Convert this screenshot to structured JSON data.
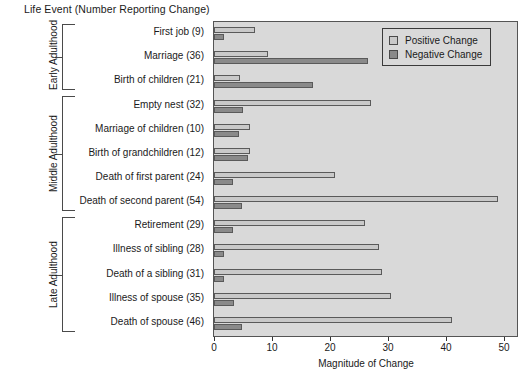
{
  "chart_data": {
    "type": "bar",
    "orientation": "horizontal",
    "title": "Life Event (Number Reporting Change)",
    "xlabel": "Magnitude of Change",
    "ylabel": "",
    "xlim": [
      0,
      50
    ],
    "xticks": [
      0,
      10,
      20,
      30,
      40,
      50
    ],
    "grid": false,
    "legend_position": "top-right",
    "legend": [
      "Positive Change",
      "Negative Change"
    ],
    "categories": [
      "First job (9)",
      "Marriage (36)",
      "Birth of children (21)",
      "Empty nest (32)",
      "Marriage of children (10)",
      "Birth of grandchildren (12)",
      "Death of first parent (24)",
      "Death of second parent (54)",
      "Retirement (29)",
      "Illness of sibling (28)",
      "Death of a sibling (31)",
      "Illness of spouse (35)",
      "Death of spouse (46)"
    ],
    "series": [
      {
        "name": "Positive Change",
        "color": "#c9c9c9",
        "values": [
          7.0,
          9.3,
          4.5,
          27.0,
          6.2,
          6.2,
          20.8,
          49.0,
          26.0,
          28.5,
          29.0,
          30.5,
          41.0
        ]
      },
      {
        "name": "Negative Change",
        "color": "#8a8a8a",
        "values": [
          1.7,
          26.5,
          17.0,
          5.0,
          4.3,
          5.8,
          3.2,
          4.8,
          3.3,
          1.7,
          1.8,
          3.5,
          4.8
        ]
      }
    ],
    "groups": [
      {
        "label": "Early Adulthood",
        "start": 0,
        "end": 2
      },
      {
        "label": "Middle Adulthood",
        "start": 3,
        "end": 7
      },
      {
        "label": "Late Adulthood",
        "start": 8,
        "end": 12
      }
    ],
    "plot_background": "#d9d9d9"
  }
}
